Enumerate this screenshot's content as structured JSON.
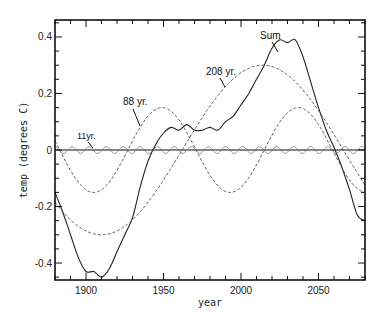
{
  "chart_data": {
    "type": "line",
    "title": "",
    "xlabel": "year",
    "ylabel": "temp (degrees C)",
    "xlim": [
      1880,
      2080
    ],
    "ylim": [
      -0.46,
      0.46
    ],
    "xticks": [
      1900,
      1950,
      2000,
      2050
    ],
    "yticks": [
      -0.4,
      -0.2,
      0,
      0.2,
      0.4
    ],
    "xtick_labels": [
      "1900",
      "1950",
      "2000",
      "2050"
    ],
    "ytick_labels": [
      "-0.4",
      "-0.2",
      "0",
      "0.2",
      "0.4"
    ],
    "grid": false,
    "legend": null,
    "zero_line": true,
    "annotations": [
      {
        "text": "Sum",
        "series": "Sum"
      },
      {
        "text": "208 yr.",
        "series": "208 yr."
      },
      {
        "text": "88 yr.",
        "series": "88 yr."
      },
      {
        "text": "11yr.",
        "series": "11 yr."
      }
    ],
    "series": [
      {
        "name": "Sum",
        "style": "solid",
        "x": [
          1880,
          1885,
          1890,
          1895,
          1900,
          1905,
          1910,
          1915,
          1920,
          1925,
          1930,
          1935,
          1940,
          1945,
          1950,
          1955,
          1960,
          1965,
          1970,
          1975,
          1980,
          1985,
          1990,
          1995,
          2000,
          2005,
          2010,
          2015,
          2020,
          2025,
          2030,
          2035,
          2040,
          2045,
          2050,
          2055,
          2060,
          2065,
          2070,
          2075,
          2080
        ],
        "y": [
          -0.15,
          -0.22,
          -0.3,
          -0.38,
          -0.43,
          -0.43,
          -0.45,
          -0.42,
          -0.36,
          -0.3,
          -0.24,
          -0.13,
          -0.04,
          0.02,
          0.06,
          0.08,
          0.07,
          0.09,
          0.07,
          0.07,
          0.08,
          0.07,
          0.1,
          0.12,
          0.16,
          0.2,
          0.25,
          0.3,
          0.36,
          0.39,
          0.38,
          0.39,
          0.33,
          0.24,
          0.15,
          0.07,
          0.01,
          -0.06,
          -0.14,
          -0.23,
          -0.25
        ]
      },
      {
        "name": "208 yr.",
        "style": "dashed",
        "period": 208,
        "amplitude": 0.3,
        "peak_year": 2014
      },
      {
        "name": "88 yr.",
        "style": "dashed",
        "period": 88,
        "amplitude": 0.15,
        "peak_year": 1949
      },
      {
        "name": "11 yr.",
        "style": "solid-thin",
        "period": 11,
        "amplitude": 0.012,
        "peak_year": 1880
      }
    ]
  },
  "labels": {
    "ylabel": "temp (degrees C)",
    "xlabel": "year",
    "sum": "Sum",
    "s208": "208 yr.",
    "s88": "88 yr.",
    "s11": "11yr."
  }
}
